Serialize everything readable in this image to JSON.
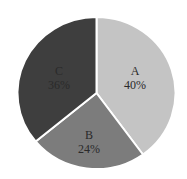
{
  "chart_data": {
    "type": "pie",
    "title": "",
    "categories": [
      "A",
      "B",
      "C"
    ],
    "values": [
      40,
      24,
      36
    ],
    "labels": [
      "40%",
      "24%",
      "36%"
    ],
    "colors": [
      "#c4c4c4",
      "#7c7c7c",
      "#3e3e3e"
    ],
    "start_angle_deg": 0,
    "direction": "clockwise",
    "legend": "none",
    "separator_color": "#ffffff"
  },
  "slices": [
    {
      "name": "A",
      "percent_label": "40%"
    },
    {
      "name": "B",
      "percent_label": "24%"
    },
    {
      "name": "C",
      "percent_label": "36%"
    }
  ]
}
